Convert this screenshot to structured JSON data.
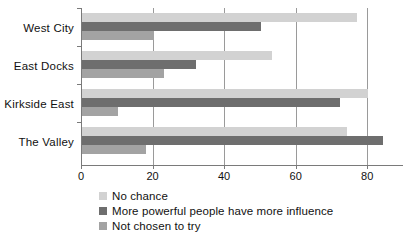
{
  "chart_data": {
    "type": "bar",
    "orientation": "horizontal",
    "title": "",
    "xlabel": "",
    "ylabel": "",
    "categories": [
      "West City",
      "East Docks",
      "Kirkside East",
      "The Valley"
    ],
    "series": [
      {
        "name": "No chance",
        "color": "#d2d2d2",
        "values": [
          77,
          53,
          80,
          74
        ]
      },
      {
        "name": "More powerful people have more influence",
        "color": "#6e6e6e",
        "values": [
          50,
          32,
          72,
          84
        ]
      },
      {
        "name": "Not chosen to try",
        "color": "#a3a3a3",
        "values": [
          20,
          23,
          10,
          18
        ]
      }
    ],
    "xlim": [
      0,
      90
    ],
    "xticks": [
      0,
      20,
      40,
      60,
      80
    ],
    "xtick_labels": [
      "0",
      "20",
      "40",
      "60",
      "80"
    ],
    "grid": "vertical",
    "legend_position": "bottom-left"
  },
  "legend": {
    "items": [
      {
        "label": "No chance",
        "color": "#d2d2d2"
      },
      {
        "label": "More powerful people have more influence",
        "color": "#6e6e6e"
      },
      {
        "label": "Not chosen to try",
        "color": "#a3a3a3"
      }
    ]
  }
}
